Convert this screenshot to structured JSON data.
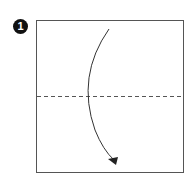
{
  "step": {
    "number": "1",
    "fold_type": "valley-fold",
    "direction": "top-to-bottom"
  },
  "colors": {
    "line": "#555555",
    "arrow": "#222222",
    "badge": "#111111"
  }
}
